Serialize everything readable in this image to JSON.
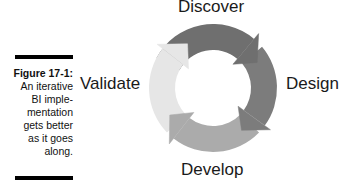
{
  "caption": {
    "figure_number": "Figure 17-1:",
    "lines": [
      "An iterative",
      "BI imple-",
      "mentation",
      "gets better",
      "as it goes",
      "along."
    ]
  },
  "cycle": {
    "direction": "clockwise",
    "stages": [
      {
        "label": "Discover",
        "position": "top",
        "color": "#6f6f6f"
      },
      {
        "label": "Design",
        "position": "right",
        "color": "#7c7c7c"
      },
      {
        "label": "Develop",
        "position": "bottom",
        "color": "#ababab"
      },
      {
        "label": "Validate",
        "position": "left",
        "color": "#e6e6e6"
      }
    ]
  }
}
